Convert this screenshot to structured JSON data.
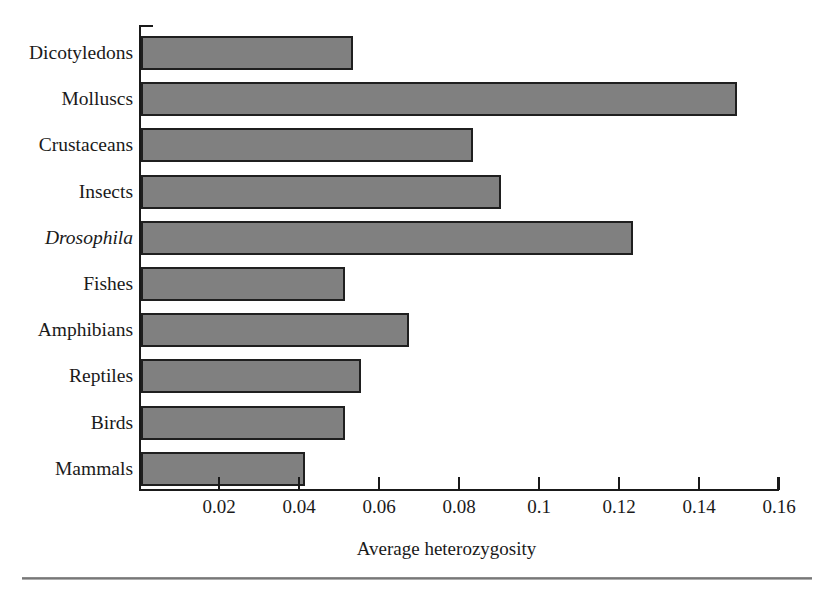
{
  "chart_data": {
    "type": "bar",
    "orientation": "horizontal",
    "title": "",
    "xlabel": "Average heterozygosity",
    "ylabel": "",
    "xlim": [
      0,
      0.16
    ],
    "grid": false,
    "legend": null,
    "xticks": [
      "0.02",
      "0.04",
      "0.06",
      "0.08",
      "0.1",
      "0.12",
      "0.14",
      "0.16"
    ],
    "xtick_values": [
      0.02,
      0.04,
      0.06,
      0.08,
      0.1,
      0.12,
      0.14,
      0.16
    ],
    "categories": [
      "Dicotyledons",
      "Molluscs",
      "Crustaceans",
      "Insects",
      "Drosophila",
      "Fishes",
      "Amphibians",
      "Reptiles",
      "Birds",
      "Mammals"
    ],
    "values": [
      0.053,
      0.149,
      0.083,
      0.09,
      0.123,
      0.051,
      0.067,
      0.055,
      0.051,
      0.041
    ],
    "bar_color": "#808080",
    "bar_edge_color": "#1f1f1f",
    "axis_color": "#1a1a1a",
    "italic_categories": [
      "Drosophila"
    ]
  },
  "figure": {
    "background": "#ffffff",
    "bottom_rule_color": "#6f6f6f"
  }
}
